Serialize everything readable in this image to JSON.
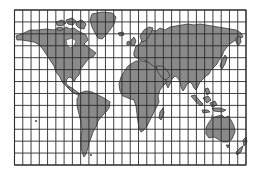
{
  "map": {
    "title": "",
    "type": "world-map-grid",
    "projection": "cylindrical-grid",
    "colors": {
      "background": "#ffffff",
      "land": "#8a8a8a",
      "land_outline": "#3a3a3a",
      "grid": "#2b2b2b"
    },
    "grid": {
      "left": 14.5,
      "top": 10,
      "right": 246,
      "bottom": 165,
      "columns": 28,
      "rows": 13
    },
    "landmasses": [
      {
        "name": "north-america"
      },
      {
        "name": "greenland"
      },
      {
        "name": "south-america"
      },
      {
        "name": "eurasia"
      },
      {
        "name": "africa"
      },
      {
        "name": "australia"
      },
      {
        "name": "madagascar"
      },
      {
        "name": "indonesia"
      },
      {
        "name": "japan"
      },
      {
        "name": "new-zealand"
      },
      {
        "name": "british-isles"
      },
      {
        "name": "arctic-islands"
      },
      {
        "name": "iceland"
      }
    ]
  }
}
